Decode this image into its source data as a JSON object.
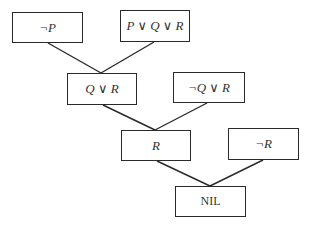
{
  "diagram": {
    "type": "resolution-refutation-tree",
    "nodes": [
      {
        "id": "n1",
        "label": "¬P",
        "x": 12,
        "y": 12,
        "w": 71,
        "h": 31,
        "italic": true
      },
      {
        "id": "n2",
        "label": "P ∨ Q ∨ R",
        "x": 120,
        "y": 10,
        "w": 70,
        "h": 32,
        "italic": true
      },
      {
        "id": "n3",
        "label": "Q ∨ R",
        "x": 67,
        "y": 73,
        "w": 70,
        "h": 32,
        "italic": true
      },
      {
        "id": "n4",
        "label": "¬Q ∨ R",
        "x": 173,
        "y": 72,
        "w": 72,
        "h": 31,
        "italic": true
      },
      {
        "id": "n5",
        "label": "R",
        "x": 121,
        "y": 130,
        "w": 70,
        "h": 31,
        "italic": true
      },
      {
        "id": "n6",
        "label": "¬R",
        "x": 228,
        "y": 128,
        "w": 71,
        "h": 32,
        "italic": true
      },
      {
        "id": "n7",
        "label": "NIL",
        "x": 175,
        "y": 186,
        "w": 71,
        "h": 31,
        "italic": false
      }
    ],
    "edges": [
      {
        "from": "n1",
        "to": "n3",
        "x1": 48,
        "y1": 43,
        "x2": 101,
        "y2": 73
      },
      {
        "from": "n2",
        "to": "n3",
        "x1": 154,
        "y1": 42,
        "x2": 101,
        "y2": 73
      },
      {
        "from": "n3",
        "to": "n5",
        "x1": 103,
        "y1": 105,
        "x2": 155,
        "y2": 130
      },
      {
        "from": "n4",
        "to": "n5",
        "x1": 207,
        "y1": 103,
        "x2": 155,
        "y2": 130
      },
      {
        "from": "n5",
        "to": "n7",
        "x1": 157,
        "y1": 161,
        "x2": 210,
        "y2": 186
      },
      {
        "from": "n6",
        "to": "n7",
        "x1": 263,
        "y1": 160,
        "x2": 210,
        "y2": 186
      }
    ],
    "colors": {
      "stroke": "#2a2a2a",
      "text": "#333333",
      "background": "#ffffff"
    }
  }
}
